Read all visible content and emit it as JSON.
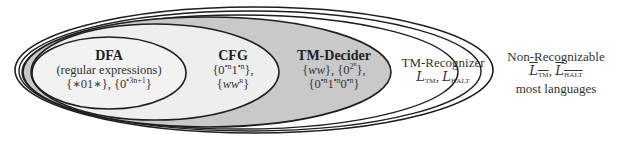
{
  "diagram": {
    "type": "nested-sets",
    "colors": {
      "stroke": "#1e1e1e",
      "recognizer_fill": "#ffffff",
      "decider_fill": "#c9c9c9",
      "cfg_fill": "#eeeeee",
      "dfa_fill": "#f2f2f2"
    },
    "regions": {
      "dfa": {
        "title": "DFA",
        "subtitle": "(regular expressions)",
        "examples": "{*01*}, {0•3n+1}"
      },
      "cfg": {
        "title": "CFG",
        "example_1": "{0•n1•n},",
        "example_2": "{wwᴿ}"
      },
      "tm_decider": {
        "title": "TM-Decider",
        "example_1": "{ww}, {0^(2^n)},",
        "example_2": "{0•n1•n0•n}"
      },
      "tm_recognizer": {
        "title": "TM-Recognizer",
        "examples": "L_TM, L_HALT"
      },
      "non_recognizable": {
        "title": "Non-Recognizable",
        "examples": "complement(L_TM), complement(L_HALT)",
        "note": "most languages"
      }
    },
    "text": {
      "dfa_title": "DFA",
      "dfa_subtitle": "(regular expressions)",
      "dfa_ex_a": "{∗01∗}, {0",
      "dfa_ex_sup": "•3n+1",
      "dfa_ex_b": "}",
      "cfg_title": "CFG",
      "cfg_ex1_a": "{0",
      "cfg_ex1_sup1": "•n",
      "cfg_ex1_b": "1",
      "cfg_ex1_sup2": "•n",
      "cfg_ex1_c": "},",
      "cfg_ex2_a": "{",
      "cfg_ex2_ww": "ww",
      "cfg_ex2_sup": "R",
      "cfg_ex2_b": "}",
      "dec_title": "TM-Decider",
      "dec_ex1_a": "{",
      "dec_ex1_ww": "ww",
      "dec_ex1_b": "}, {0",
      "dec_ex1_sup": "2",
      "dec_ex1_supsup": "n",
      "dec_ex1_c": "},",
      "dec_ex2_a": "{0",
      "dec_ex2_s1": "•n",
      "dec_ex2_b": "1",
      "dec_ex2_s2": "•n",
      "dec_ex2_c": "0",
      "dec_ex2_s3": "•n",
      "dec_ex2_d": "}",
      "rec_title": "TM-Recognizer",
      "rec_L1": "L",
      "rec_L1_sub": "TM",
      "rec_comma": ", ",
      "rec_L2": "L",
      "rec_L2_sub": "HALT",
      "non_title": "Non-Recognizable",
      "non_L1": "L",
      "non_L1_sub": "TM",
      "non_comma": ", ",
      "non_L2": "L",
      "non_L2_sub": "HALT",
      "non_note": "most languages"
    }
  }
}
